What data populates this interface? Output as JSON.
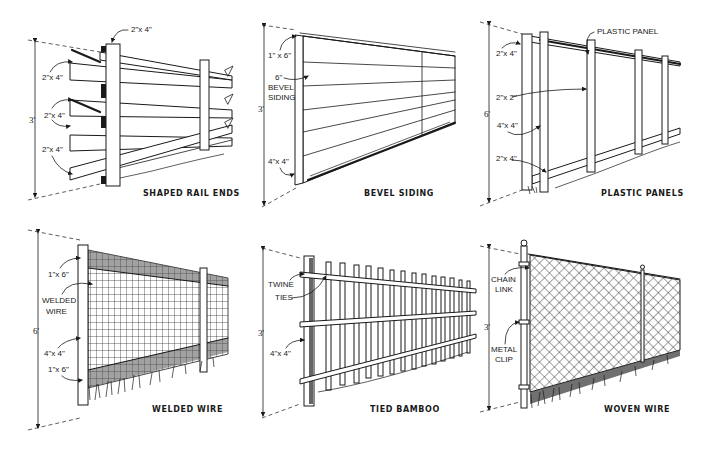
{
  "panels": [
    {
      "id": "shaped-rail-ends",
      "caption": "SHAPED RAIL ENDS",
      "height": "3'",
      "labels": [
        "2\"x 4\"",
        "2\"x 4\"",
        "2\"x 4\"",
        "2\"x 4\""
      ]
    },
    {
      "id": "bevel-siding",
      "caption": "BEVEL SIDING",
      "height": "3'",
      "labels": [
        "1\" x 6\"",
        "6\"",
        "BEVEL",
        "SIDING",
        "4\"x 4\""
      ]
    },
    {
      "id": "plastic-panels",
      "caption": "PLASTIC PANELS",
      "height": "6'",
      "labels": [
        "PLASTIC PANEL",
        "2\"x 4\"",
        "2\"x 2\"",
        "4\"x 4\"",
        "2\"x 4\""
      ]
    },
    {
      "id": "welded-wire",
      "caption": "WELDED WIRE",
      "height": "6'",
      "labels": [
        "1\"x 6\"",
        "WELDED",
        "WIRE",
        "4\"x 4\"",
        "1\"x 6\""
      ]
    },
    {
      "id": "tied-bamboo",
      "caption": "TIED BAMBOO",
      "height": "3'",
      "labels": [
        "TWINE",
        "TIES",
        "4\"x 4\""
      ]
    },
    {
      "id": "woven-wire",
      "caption": "WOVEN WIRE",
      "height": "3'",
      "labels": [
        "CHAIN",
        "LINK",
        "METAL",
        "CLIP"
      ]
    }
  ]
}
